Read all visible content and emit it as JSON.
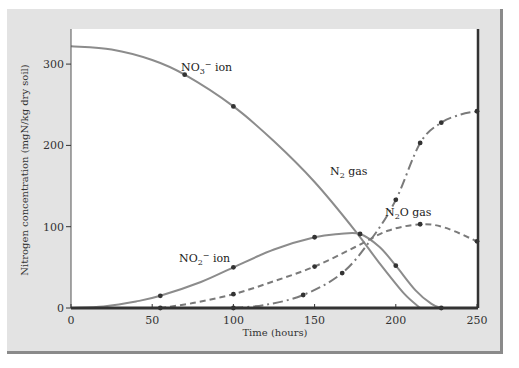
{
  "chart_data": {
    "type": "line",
    "title": "",
    "xlabel": "Time (hours)",
    "ylabel": "Nitrogen concentration (mgN/kg dry soil)",
    "xlim": [
      0,
      250
    ],
    "ylim": [
      0,
      330
    ],
    "x_ticks": [
      0,
      50,
      100,
      150,
      200,
      250
    ],
    "y_ticks": [
      0,
      100,
      200,
      300
    ],
    "grid": false,
    "legend_position": "inline labels",
    "series": [
      {
        "name": "NO3- ion",
        "label_main": "NO",
        "label_sub": "3",
        "label_sup": "−",
        "label_rest": " ion",
        "style": "solid",
        "color": "#8c8c8c",
        "curve": [
          [
            0,
            322
          ],
          [
            25,
            318
          ],
          [
            50,
            305
          ],
          [
            70,
            287
          ],
          [
            100,
            248
          ],
          [
            125,
            205
          ],
          [
            150,
            155
          ],
          [
            175,
            95
          ],
          [
            190,
            55
          ],
          [
            205,
            18
          ],
          [
            215,
            0
          ]
        ],
        "points": [
          [
            70,
            287
          ],
          [
            100,
            248
          ]
        ]
      },
      {
        "name": "NO2- ion",
        "label_main": "NO",
        "label_sub": "2",
        "label_sup": "−",
        "label_rest": " ion",
        "style": "solid",
        "color": "#8c8c8c",
        "curve": [
          [
            0,
            0
          ],
          [
            20,
            2
          ],
          [
            40,
            8
          ],
          [
            55,
            15
          ],
          [
            80,
            32
          ],
          [
            100,
            50
          ],
          [
            125,
            72
          ],
          [
            150,
            87
          ],
          [
            165,
            91
          ],
          [
            178,
            91
          ],
          [
            190,
            75
          ],
          [
            200,
            52
          ],
          [
            212,
            22
          ],
          [
            222,
            5
          ],
          [
            228,
            0
          ]
        ],
        "points": [
          [
            55,
            15
          ],
          [
            100,
            50
          ],
          [
            150,
            87
          ],
          [
            178,
            91
          ],
          [
            200,
            52
          ],
          [
            228,
            0
          ]
        ]
      },
      {
        "name": "N2O gas",
        "label_main": "N",
        "label_sub": "2",
        "label_sup": "",
        "label_rest": "O gas",
        "style": "dashed",
        "color": "#7a7a7a",
        "curve": [
          [
            55,
            0
          ],
          [
            75,
            6
          ],
          [
            100,
            17
          ],
          [
            125,
            33
          ],
          [
            150,
            51
          ],
          [
            175,
            75
          ],
          [
            195,
            95
          ],
          [
            215,
            103
          ],
          [
            230,
            99
          ],
          [
            250,
            82
          ]
        ],
        "points": [
          [
            55,
            0
          ],
          [
            100,
            17
          ],
          [
            150,
            51
          ],
          [
            215,
            103
          ],
          [
            250,
            82
          ]
        ]
      },
      {
        "name": "N2 gas",
        "label_main": "N",
        "label_sub": "2",
        "label_sup": "",
        "label_rest": " gas",
        "style": "dash-dot",
        "color": "#7a7a7a",
        "curve": [
          [
            100,
            0
          ],
          [
            120,
            4
          ],
          [
            143,
            16
          ],
          [
            167,
            43
          ],
          [
            185,
            85
          ],
          [
            200,
            133
          ],
          [
            215,
            203
          ],
          [
            228,
            228
          ],
          [
            240,
            238
          ],
          [
            250,
            242
          ]
        ],
        "points": [
          [
            100,
            0
          ],
          [
            143,
            16
          ],
          [
            167,
            43
          ],
          [
            200,
            133
          ],
          [
            215,
            203
          ],
          [
            228,
            228
          ],
          [
            250,
            242
          ]
        ]
      }
    ]
  },
  "colors": {
    "panel_bg": "#e3e3e3",
    "plot_bg": "#ffffff",
    "axis": "#333333",
    "point": "#333333"
  }
}
